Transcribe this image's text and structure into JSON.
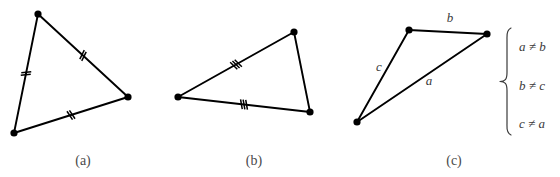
{
  "figure": {
    "background_color": "#ffffff",
    "ink_color": "#000000",
    "label_color": "#3a3a3a",
    "caption_color": "#4a4a4a",
    "panels": [
      {
        "id": "panel-a",
        "caption": "(a)",
        "caption_x": 83,
        "caption_y": 165,
        "kind": "equilateral-triangle",
        "vertices": [
          {
            "name": "top",
            "x": 38,
            "y": 14
          },
          {
            "name": "right",
            "x": 128,
            "y": 97
          },
          {
            "name": "bottom-left",
            "x": 14,
            "y": 133
          }
        ],
        "edges": [
          {
            "name": "edge-top-right",
            "from": 0,
            "to": 1,
            "ticks": 2
          },
          {
            "name": "edge-right-bottom",
            "from": 1,
            "to": 2,
            "ticks": 2
          },
          {
            "name": "edge-bottom-top",
            "from": 2,
            "to": 0,
            "ticks": 2
          }
        ]
      },
      {
        "id": "panel-b",
        "caption": "(b)",
        "caption_x": 254,
        "caption_y": 165,
        "kind": "isosceles-triangle",
        "vertices": [
          {
            "name": "top-right",
            "x": 294,
            "y": 32
          },
          {
            "name": "bottom-right",
            "x": 310,
            "y": 112
          },
          {
            "name": "left",
            "x": 178,
            "y": 97
          }
        ],
        "edges": [
          {
            "name": "edge-top-bottom",
            "from": 0,
            "to": 1,
            "ticks": 0
          },
          {
            "name": "edge-bottom-left",
            "from": 1,
            "to": 2,
            "ticks": 3
          },
          {
            "name": "edge-left-top",
            "from": 2,
            "to": 0,
            "ticks": 3
          }
        ]
      },
      {
        "id": "panel-c",
        "caption": "(c)",
        "caption_x": 454,
        "caption_y": 165,
        "kind": "scalene-triangle",
        "vertices": [
          {
            "name": "top-left",
            "x": 409,
            "y": 30
          },
          {
            "name": "top-right",
            "x": 487,
            "y": 34
          },
          {
            "name": "bottom-left",
            "x": 357,
            "y": 122
          }
        ],
        "edges": [
          {
            "name": "edge-b",
            "from": 0,
            "to": 1,
            "ticks": 0
          },
          {
            "name": "edge-a",
            "from": 1,
            "to": 2,
            "ticks": 0
          },
          {
            "name": "edge-c",
            "from": 2,
            "to": 0,
            "ticks": 0
          }
        ],
        "side_labels": [
          {
            "name": "side-label-b",
            "text": "b",
            "x": 450,
            "y": 22
          },
          {
            "name": "side-label-c",
            "text": "c",
            "x": 379,
            "y": 71
          },
          {
            "name": "side-label-a",
            "text": "a",
            "x": 429,
            "y": 85
          }
        ],
        "brace": {
          "name": "relations-brace",
          "x_spine": 507,
          "x_tip": 500,
          "y_top": 28,
          "y_bottom": 135
        },
        "relations": [
          {
            "name": "relation-a-ne-b",
            "text": "a ≠ b",
            "x": 519,
            "y": 51
          },
          {
            "name": "relation-b-ne-c",
            "text": "b ≠ c",
            "x": 519,
            "y": 90
          },
          {
            "name": "relation-c-ne-a",
            "text": "c ≠ a",
            "x": 519,
            "y": 128
          }
        ]
      }
    ]
  }
}
